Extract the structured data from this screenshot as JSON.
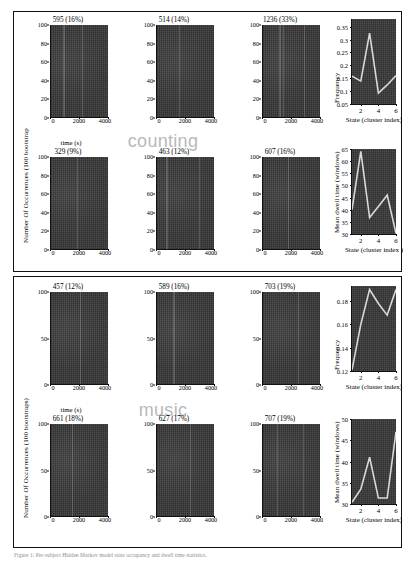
{
  "figure": {
    "caption": "Figure 1: Per-subject Hidden Markov model state occupancy and dwell time statistics."
  },
  "panels": [
    {
      "id": "counting",
      "watermark": "counting",
      "ylabel": "Number Of Occurrences (100 bootstrap",
      "xlabel": "time (s)",
      "histograms": [
        {
          "title": "595 (16%)",
          "count": 595,
          "percent": "16%"
        },
        {
          "title": "514 (14%)",
          "count": 514,
          "percent": "14%"
        },
        {
          "title": "1236 (33%)",
          "count": 1236,
          "percent": "33%"
        },
        {
          "title": "329 (9%)",
          "count": 329,
          "percent": "9%"
        },
        {
          "title": "463 (12%)",
          "count": 463,
          "percent": "12%"
        },
        {
          "title": "607 (16%)",
          "count": 607,
          "percent": "16%"
        }
      ],
      "hist_axes": {
        "yticks": [
          "0",
          "20",
          "40",
          "60",
          "80",
          "100"
        ],
        "xticks": [
          "0",
          "2000",
          "4000"
        ],
        "ylim": [
          0,
          100
        ],
        "xlim": [
          0,
          4000
        ]
      }
    },
    {
      "id": "music",
      "watermark": "music",
      "ylabel": "Number Of Occurrences (100 bootstraps)",
      "xlabel": "time (s)",
      "histograms": [
        {
          "title": "457 (12%)",
          "count": 457,
          "percent": "12%"
        },
        {
          "title": "589 (16%)",
          "count": 589,
          "percent": "16%"
        },
        {
          "title": "703 (19%)",
          "count": 703,
          "percent": "19%"
        },
        {
          "title": "661 (18%)",
          "count": 661,
          "percent": "18%"
        },
        {
          "title": "627 (17%)",
          "count": 627,
          "percent": "17%"
        },
        {
          "title": "707 (19%)",
          "count": 707,
          "percent": "19%"
        }
      ],
      "hist_axes": {
        "yticks": [
          "0",
          "50",
          "100"
        ],
        "xticks": [
          "0",
          "2000",
          "4000"
        ],
        "ylim": [
          0,
          100
        ],
        "xlim": [
          0,
          4000
        ]
      }
    }
  ],
  "chart_data": [
    {
      "id": "counting-frequency",
      "type": "line",
      "title": "",
      "xlabel": "State (cluster index)",
      "ylabel": "Frequency",
      "x": [
        1,
        2,
        3,
        4,
        5,
        6
      ],
      "values": [
        0.158,
        0.139,
        0.325,
        0.092,
        0.124,
        0.16
      ],
      "xticks": [
        "2",
        "4",
        "6"
      ],
      "yticks": [
        "0.05",
        "0.1",
        "0.15",
        "0.2",
        "0.25",
        "0.3",
        "0.35"
      ],
      "xlim": [
        1,
        6
      ],
      "ylim": [
        0.05,
        0.38
      ],
      "grid": false,
      "legend": "none",
      "line_color": "#d8d8d8"
    },
    {
      "id": "counting-dwell",
      "type": "line",
      "title": "",
      "xlabel": "State (cluster index )",
      "ylabel": "Mean dwell time (windows)",
      "x": [
        1,
        2,
        3,
        4,
        5,
        6
      ],
      "values": [
        40.0,
        64.0,
        36.8,
        41.3,
        46.0,
        30.3
      ],
      "xticks": [
        "2",
        "4",
        "6"
      ],
      "yticks": [
        "30",
        "35",
        "40",
        "45",
        "50",
        "55",
        "60",
        "65"
      ],
      "xlim": [
        1,
        6
      ],
      "ylim": [
        30,
        65
      ],
      "grid": false,
      "legend": "none",
      "line_color": "#d8d8d8"
    },
    {
      "id": "music-frequency",
      "type": "line",
      "title": "",
      "xlabel": "State (cluster index)",
      "ylabel": "Frequency",
      "x": [
        1,
        2,
        3,
        4,
        5,
        6
      ],
      "values": [
        0.121,
        0.16,
        0.19,
        0.178,
        0.168,
        0.19
      ],
      "xticks": [
        "2",
        "4",
        "6"
      ],
      "yticks": [
        "0.12",
        "0.14",
        "0.16",
        "0.18"
      ],
      "xlim": [
        1,
        6
      ],
      "ylim": [
        0.12,
        0.193
      ],
      "grid": false,
      "legend": "none",
      "line_color": "#d8d8d8"
    },
    {
      "id": "music-dwell",
      "type": "line",
      "title": "",
      "xlabel": "State (cluster index)",
      "ylabel": "Mean dwell time (windows)",
      "x": [
        1,
        2,
        3,
        4,
        5,
        6
      ],
      "values": [
        30.4,
        33.5,
        41.0,
        31.4,
        31.4,
        47.0
      ],
      "xticks": [
        "2",
        "4",
        "6"
      ],
      "yticks": [
        "30",
        "35",
        "40",
        "45",
        "50"
      ],
      "xlim": [
        1,
        6
      ],
      "ylim": [
        30,
        50
      ],
      "grid": false,
      "legend": "none",
      "line_color": "#d8d8d8"
    }
  ]
}
